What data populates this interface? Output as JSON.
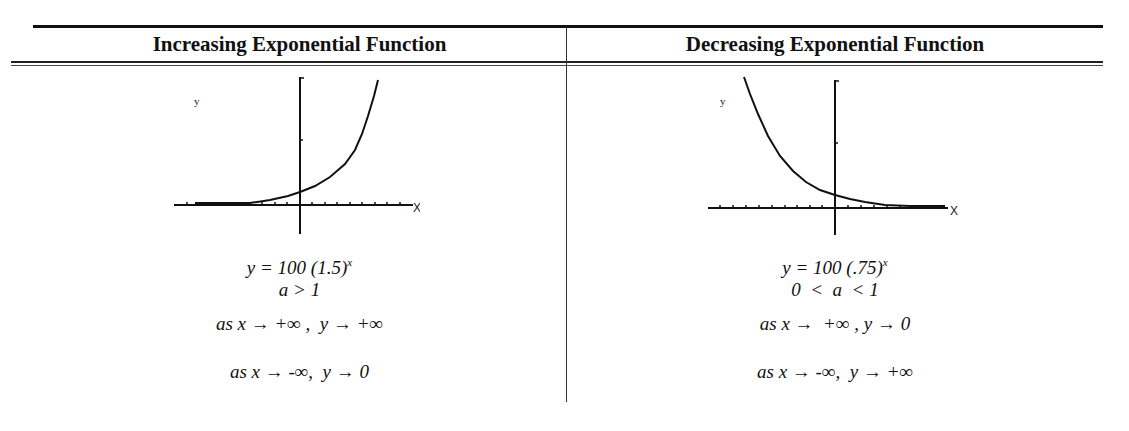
{
  "table": {
    "columns": [
      {
        "header": "Increasing Exponential Function",
        "graph": {
          "y_label": "y",
          "x_label": "X",
          "curve": "increasing"
        },
        "equation_base": "y = 100 (1.5)",
        "equation_exponent": "x",
        "condition": "a > 1",
        "limit_pos": "as x → +∞ ,  y → +∞",
        "limit_neg": "as x → -∞,  y → 0"
      },
      {
        "header": "Decreasing Exponential Function",
        "graph": {
          "y_label": "y",
          "x_label": "X",
          "curve": "decreasing"
        },
        "equation_base": "y = 100 (.75)",
        "equation_exponent": "x",
        "condition": "0  <  a  < 1",
        "limit_pos": "as x →  +∞ , y → 0",
        "limit_neg": "as x → -∞,  y → +∞"
      }
    ]
  }
}
